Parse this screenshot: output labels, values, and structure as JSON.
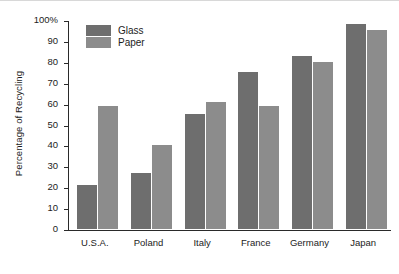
{
  "chart_data": {
    "type": "bar",
    "title": "",
    "xlabel": "",
    "ylabel": "Percentage of Recycling",
    "categories": [
      "U.S.A.",
      "Poland",
      "Italy",
      "France",
      "Germany",
      "Japan"
    ],
    "series": [
      {
        "name": "Glass",
        "color": "#6e6e6e",
        "values": [
          21,
          27,
          55,
          75,
          83,
          98
        ]
      },
      {
        "name": "Paper",
        "color": "#8c8c8c",
        "values": [
          59,
          40,
          61,
          59,
          80,
          95
        ]
      }
    ],
    "ylim": [
      0,
      100
    ],
    "yticks": [
      0,
      10,
      20,
      30,
      40,
      50,
      60,
      70,
      80,
      90,
      100
    ],
    "ytick_labels": [
      "0",
      "10",
      "20",
      "30",
      "40",
      "50",
      "60",
      "70",
      "80",
      "90",
      "100%"
    ],
    "grid": false,
    "legend_position": "upper-left-inside"
  },
  "legend": {
    "items": [
      {
        "label": "Glass",
        "swatch": "legend-swatch-glass"
      },
      {
        "label": "Paper",
        "swatch": "legend-swatch-paper"
      }
    ]
  }
}
